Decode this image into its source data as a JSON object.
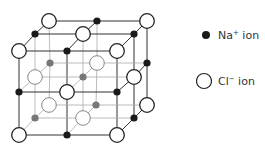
{
  "diagram": {
    "colors": {
      "na_ion": "#1a1a1a",
      "na_ion_back": "#777777",
      "cl_ion_fill": "#ffffff",
      "cl_ion_stroke": "#222222",
      "cl_ion_stroke_back": "#888888",
      "edge_front": "#333333",
      "edge_back": "#aaaaaa"
    },
    "nodes": [
      {
        "x": 49,
        "y": 21,
        "type": "Cl",
        "depth": "back"
      },
      {
        "x": 97,
        "y": 21,
        "type": "Na",
        "depth": "back"
      },
      {
        "x": 147,
        "y": 21,
        "type": "Cl",
        "depth": "back"
      },
      {
        "x": 35,
        "y": 34,
        "type": "Na",
        "depth": "mid"
      },
      {
        "x": 83,
        "y": 34,
        "type": "Cl",
        "depth": "mid"
      },
      {
        "x": 134,
        "y": 34,
        "type": "Na",
        "depth": "mid"
      },
      {
        "x": 19,
        "y": 51,
        "type": "Cl",
        "depth": "front"
      },
      {
        "x": 67,
        "y": 51,
        "type": "Na",
        "depth": "front"
      },
      {
        "x": 117,
        "y": 51,
        "type": "Cl",
        "depth": "front"
      },
      {
        "x": 50,
        "y": 63,
        "type": "Na",
        "depth": "back-inner"
      },
      {
        "x": 97,
        "y": 63,
        "type": "Cl",
        "depth": "back-inner"
      },
      {
        "x": 147,
        "y": 63,
        "type": "Na",
        "depth": "back"
      },
      {
        "x": 35,
        "y": 77,
        "type": "Cl",
        "depth": "mid-inner"
      },
      {
        "x": 83,
        "y": 77,
        "type": "Na",
        "depth": "mid-inner"
      },
      {
        "x": 134,
        "y": 77,
        "type": "Cl",
        "depth": "mid"
      },
      {
        "x": 19,
        "y": 92,
        "type": "Na",
        "depth": "front"
      },
      {
        "x": 67,
        "y": 92,
        "type": "Cl",
        "depth": "front"
      },
      {
        "x": 117,
        "y": 92,
        "type": "Na",
        "depth": "front"
      },
      {
        "x": 49,
        "y": 105,
        "type": "Cl",
        "depth": "back-inner"
      },
      {
        "x": 96,
        "y": 105,
        "type": "Na",
        "depth": "back-inner"
      },
      {
        "x": 147,
        "y": 105,
        "type": "Cl",
        "depth": "back"
      },
      {
        "x": 35,
        "y": 118,
        "type": "Na",
        "depth": "mid-inner"
      },
      {
        "x": 83,
        "y": 118,
        "type": "Cl",
        "depth": "mid-inner"
      },
      {
        "x": 134,
        "y": 118,
        "type": "Na",
        "depth": "mid"
      },
      {
        "x": 19,
        "y": 135,
        "type": "Cl",
        "depth": "front"
      },
      {
        "x": 67,
        "y": 135,
        "type": "Na",
        "depth": "front"
      },
      {
        "x": 117,
        "y": 135,
        "type": "Cl",
        "depth": "front"
      }
    ]
  },
  "legend": {
    "na": {
      "label": "Na",
      "charge": "+",
      "suffix": " ion"
    },
    "cl": {
      "label": "Cl",
      "charge": "−",
      "suffix": " ion"
    }
  }
}
